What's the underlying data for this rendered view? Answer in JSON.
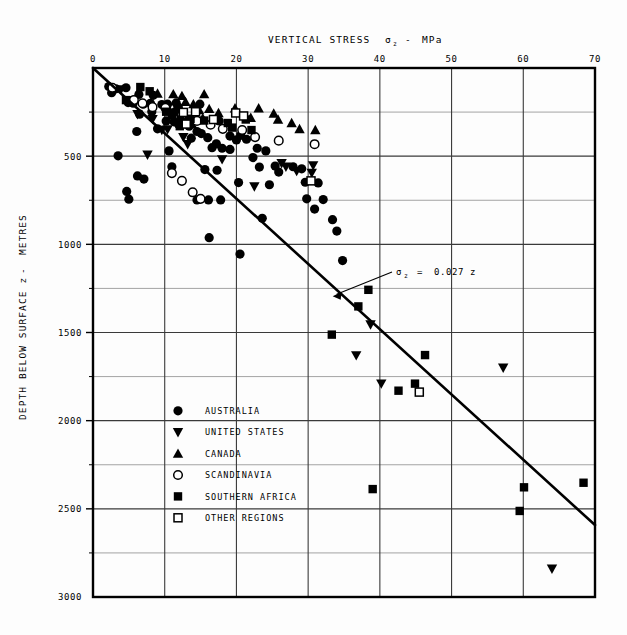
{
  "chart_data": {
    "type": "scatter",
    "title_parts": {
      "main": "VERTICAL STRESS",
      "sym": "σ",
      "sub": "z",
      "dash": "-",
      "unit": "MPa"
    },
    "xlabel": "VERTICAL STRESS σz - MPa",
    "ylabel": "DEPTH BELOW SURFACE z  -  METRES",
    "ylabel_parts": {
      "main": "DEPTH BELOW SURFACE z",
      "dash": "-",
      "unit": "METRES"
    },
    "xlim": [
      0,
      70
    ],
    "ylim": [
      0,
      3000
    ],
    "y_inverted": true,
    "x_ticks": [
      0,
      10,
      20,
      30,
      40,
      50,
      60,
      70
    ],
    "x_tick_labels": [
      "0",
      "10",
      "20",
      "30",
      "40",
      "50",
      "60",
      "70"
    ],
    "y_ticks": [
      0,
      500,
      1000,
      1500,
      2000,
      2500,
      3000
    ],
    "y_tick_labels": [
      "",
      "500",
      "1000",
      "1500",
      "2000",
      "2500",
      "3000"
    ],
    "y_minor_ticks": [
      250,
      750,
      1250,
      1750,
      2250,
      2750
    ],
    "grid": true,
    "grid_x_major": [
      10,
      20,
      30,
      40,
      50,
      60
    ],
    "grid_y_major": [
      500,
      1000,
      1500,
      2000,
      2500
    ],
    "grid_y_minor": [
      250,
      750,
      1250,
      1750,
      2250,
      2750
    ],
    "annotation": {
      "text": "σz  =  0.027 z",
      "parts": {
        "sym": "σ",
        "sub": "z",
        "eq": "=",
        "value": "0.027 z"
      },
      "x_mpa": 45.5,
      "y_m": 1180,
      "arrow_to_x_mpa": 33.0,
      "arrow_to_y_m": 1300
    },
    "trendline": {
      "label": "σz = 0.027 z",
      "slope_mpa_per_m": 0.027,
      "from": [
        0,
        0
      ],
      "to": [
        70,
        2592
      ]
    },
    "legend": {
      "position": "inside-lower-left",
      "entries": [
        {
          "marker": "filled-circle",
          "label": "AUSTRALIA"
        },
        {
          "marker": "filled-down-triangle",
          "label": "UNITED STATES"
        },
        {
          "marker": "filled-up-triangle",
          "label": "CANADA"
        },
        {
          "marker": "open-circle",
          "label": "SCANDINAVIA"
        },
        {
          "marker": "filled-square",
          "label": "SOUTHERN AFRICA"
        },
        {
          "marker": "open-square",
          "label": "OTHER REGIONS"
        }
      ]
    },
    "series": [
      {
        "name": "AUSTRALIA",
        "marker": "filled-circle",
        "points": [
          [
            2.2,
            105
          ],
          [
            3.2,
            118
          ],
          [
            4.6,
            112
          ],
          [
            2.6,
            140
          ],
          [
            6.4,
            150
          ],
          [
            8.4,
            155
          ],
          [
            4.9,
            196
          ],
          [
            5.6,
            200
          ],
          [
            7.0,
            205
          ],
          [
            8.0,
            200
          ],
          [
            9.6,
            207
          ],
          [
            10.4,
            205
          ],
          [
            11.6,
            198
          ],
          [
            11.9,
            222
          ],
          [
            14.9,
            205
          ],
          [
            11.5,
            247
          ],
          [
            8.2,
            248
          ],
          [
            6.5,
            262
          ],
          [
            10.2,
            300
          ],
          [
            11.3,
            305
          ],
          [
            11.9,
            318
          ],
          [
            12.8,
            300
          ],
          [
            17.6,
            300
          ],
          [
            13.4,
            330
          ],
          [
            9.0,
            345
          ],
          [
            6.1,
            360
          ],
          [
            14.5,
            360
          ],
          [
            15.1,
            372
          ],
          [
            13.7,
            398
          ],
          [
            16.0,
            395
          ],
          [
            19.1,
            386
          ],
          [
            20.6,
            382
          ],
          [
            20.0,
            408
          ],
          [
            21.4,
            404
          ],
          [
            17.2,
            430
          ],
          [
            16.6,
            452
          ],
          [
            18.0,
            455
          ],
          [
            19.1,
            462
          ],
          [
            22.9,
            455
          ],
          [
            24.1,
            470
          ],
          [
            10.6,
            470
          ],
          [
            3.5,
            498
          ],
          [
            22.3,
            508
          ],
          [
            11.0,
            560
          ],
          [
            15.6,
            576
          ],
          [
            17.3,
            580
          ],
          [
            23.2,
            562
          ],
          [
            25.4,
            556
          ],
          [
            27.9,
            560
          ],
          [
            29.1,
            572
          ],
          [
            25.9,
            590
          ],
          [
            6.2,
            612
          ],
          [
            7.1,
            630
          ],
          [
            20.3,
            650
          ],
          [
            24.6,
            662
          ],
          [
            29.6,
            648
          ],
          [
            31.4,
            652
          ],
          [
            4.7,
            700
          ],
          [
            5.0,
            744
          ],
          [
            14.5,
            748
          ],
          [
            16.1,
            748
          ],
          [
            17.8,
            748
          ],
          [
            29.8,
            742
          ],
          [
            32.1,
            746
          ],
          [
            30.9,
            800
          ],
          [
            23.6,
            852
          ],
          [
            33.4,
            860
          ],
          [
            34.0,
            925
          ],
          [
            16.2,
            962
          ],
          [
            20.5,
            1055
          ],
          [
            34.8,
            1092
          ]
        ]
      },
      {
        "name": "UNITED STATES",
        "marker": "filled-down-triangle",
        "points": [
          [
            3.9,
            122
          ],
          [
            5.4,
            183
          ],
          [
            6.2,
            262
          ],
          [
            8.3,
            290
          ],
          [
            9.6,
            352
          ],
          [
            10.4,
            348
          ],
          [
            12.6,
            392
          ],
          [
            13.2,
            432
          ],
          [
            7.6,
            492
          ],
          [
            18.0,
            518
          ],
          [
            26.3,
            540
          ],
          [
            26.9,
            560
          ],
          [
            30.7,
            552
          ],
          [
            28.4,
            585
          ],
          [
            30.5,
            595
          ],
          [
            22.5,
            672
          ],
          [
            38.7,
            1455
          ],
          [
            36.7,
            1630
          ],
          [
            40.2,
            1790
          ],
          [
            64.0,
            2840
          ],
          [
            57.2,
            1700
          ]
        ]
      },
      {
        "name": "CANADA",
        "marker": "filled-up-triangle",
        "points": [
          [
            9.0,
            145
          ],
          [
            11.2,
            148
          ],
          [
            12.4,
            158
          ],
          [
            15.5,
            148
          ],
          [
            12.9,
            192
          ],
          [
            14.0,
            205
          ],
          [
            10.5,
            225
          ],
          [
            11.7,
            232
          ],
          [
            14.8,
            238
          ],
          [
            16.2,
            232
          ],
          [
            19.8,
            228
          ],
          [
            23.1,
            228
          ],
          [
            17.5,
            255
          ],
          [
            15.3,
            285
          ],
          [
            22.0,
            282
          ],
          [
            25.2,
            258
          ],
          [
            25.8,
            292
          ],
          [
            27.7,
            312
          ],
          [
            13.8,
            318
          ],
          [
            28.8,
            346
          ],
          [
            31.0,
            352
          ]
        ]
      },
      {
        "name": "SCANDINAVIA",
        "marker": "open-circle",
        "points": [
          [
            2.7,
            112
          ],
          [
            5.7,
            182
          ],
          [
            6.9,
            200
          ],
          [
            8.3,
            222
          ],
          [
            10.1,
            226
          ],
          [
            12.4,
            268
          ],
          [
            14.5,
            300
          ],
          [
            16.4,
            322
          ],
          [
            18.1,
            345
          ],
          [
            20.8,
            352
          ],
          [
            22.6,
            392
          ],
          [
            25.9,
            412
          ],
          [
            30.9,
            432
          ],
          [
            11.0,
            596
          ],
          [
            12.4,
            640
          ],
          [
            13.9,
            705
          ],
          [
            15.0,
            742
          ]
        ]
      },
      {
        "name": "SOUTHERN AFRICA",
        "marker": "filled-square",
        "points": [
          [
            6.6,
            108
          ],
          [
            7.9,
            132
          ],
          [
            4.6,
            182
          ],
          [
            10.2,
            248
          ],
          [
            11.0,
            268
          ],
          [
            12.2,
            292
          ],
          [
            13.6,
            288
          ],
          [
            15.5,
            298
          ],
          [
            18.8,
            312
          ],
          [
            21.3,
            292
          ],
          [
            12.1,
            330
          ],
          [
            19.4,
            338
          ],
          [
            22.1,
            352
          ],
          [
            38.4,
            1258
          ],
          [
            37.0,
            1352
          ],
          [
            33.3,
            1512
          ],
          [
            46.3,
            1628
          ],
          [
            44.9,
            1790
          ],
          [
            42.6,
            1830
          ],
          [
            39.0,
            2388
          ],
          [
            60.1,
            2378
          ],
          [
            68.4,
            2352
          ],
          [
            59.5,
            2512
          ]
        ]
      },
      {
        "name": "OTHER REGIONS",
        "marker": "open-square",
        "points": [
          [
            12.6,
            252
          ],
          [
            14.3,
            248
          ],
          [
            19.9,
            255
          ],
          [
            21.0,
            272
          ],
          [
            16.8,
            292
          ],
          [
            13.0,
            318
          ],
          [
            45.5,
            1838
          ],
          [
            30.4,
            640
          ]
        ]
      }
    ]
  }
}
